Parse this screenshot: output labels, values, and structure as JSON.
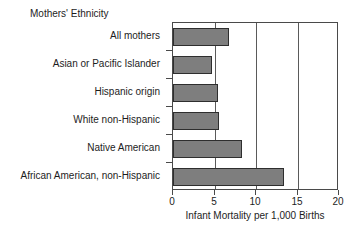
{
  "chart_data": {
    "type": "bar",
    "orientation": "horizontal",
    "title": "Mothers' Ethnicity",
    "xlabel": "Infant Mortality per 1,000 Births",
    "ylabel": "",
    "categories": [
      "All mothers",
      "Asian or Pacific Islander",
      "Hispanic origin",
      "White non-Hispanic",
      "Native American",
      "African American, non-Hispanic"
    ],
    "values": [
      6.7,
      4.7,
      5.4,
      5.6,
      8.3,
      13.4
    ],
    "xlim": [
      0,
      20
    ],
    "xticks": [
      0,
      5,
      10,
      15,
      20
    ],
    "xtick_labels": [
      "0",
      "5",
      "10",
      "15",
      "20"
    ],
    "gridlines": [
      5,
      10,
      15
    ],
    "grid": true,
    "legend": null,
    "bar_color": "#7e7e7e",
    "bar_border_color": "#2e2e2e",
    "axis_color": "#4a4a4a"
  }
}
